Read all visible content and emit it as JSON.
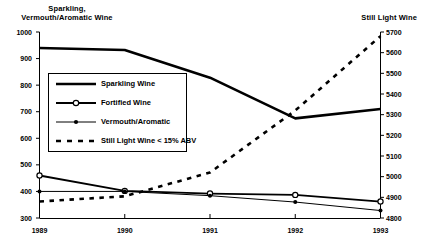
{
  "chart_data": {
    "type": "line",
    "title": "",
    "xlabel": "",
    "x": [
      "1989",
      "1990",
      "1991",
      "1992",
      "1993"
    ],
    "left_axis": {
      "label": "Sparkling, Vermouth/Aromatic Wine",
      "ylim": [
        300,
        1000
      ],
      "ticks": [
        "300",
        "400",
        "500",
        "600",
        "700",
        "800",
        "900",
        "1000"
      ],
      "tick_values": [
        300,
        400,
        500,
        600,
        700,
        800,
        900,
        1000
      ]
    },
    "right_axis": {
      "label": "Still Light Wine",
      "ylim": [
        4800,
        5700
      ],
      "ticks": [
        "4800",
        "4900",
        "5000",
        "5100",
        "5200",
        "5300",
        "5400",
        "5500",
        "5600",
        "5700"
      ],
      "tick_values": [
        4800,
        4900,
        5000,
        5100,
        5200,
        5300,
        5400,
        5500,
        5600,
        5700
      ]
    },
    "grid": false,
    "legend_position": "upper-left-inside",
    "series": [
      {
        "name": "Sparkling Wine",
        "axis": "left",
        "style": "solid-thick",
        "marker": "none",
        "values": [
          940,
          932,
          828,
          675,
          710
        ]
      },
      {
        "name": "Fortified Wine",
        "axis": "left",
        "style": "solid",
        "marker": "open-circle",
        "values": [
          460,
          402,
          392,
          387,
          362
        ]
      },
      {
        "name": "Vermouth/Aromatic",
        "axis": "left",
        "style": "thin",
        "marker": "filled-dot",
        "values": [
          400,
          400,
          384,
          360,
          328
        ]
      },
      {
        "name": "Still Light Wine < 15% ABV",
        "axis": "right",
        "style": "dashed",
        "marker": "none",
        "values": [
          4880,
          4905,
          5020,
          5320,
          5680
        ]
      }
    ]
  },
  "legend": {
    "entries": [
      {
        "label": "Sparkling Wine"
      },
      {
        "label": "Fortified Wine"
      },
      {
        "label": "Vermouth/Aromatic"
      },
      {
        "label": "Still Light Wine < 15% ABV"
      }
    ]
  },
  "axis_titles": {
    "left_line1": "Sparkling,",
    "left_line2": "Vermouth/Aromatic Wine",
    "right": "Still Light Wine"
  }
}
